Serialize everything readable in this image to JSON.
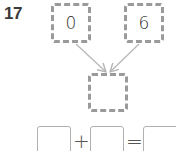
{
  "question": {
    "number": "17"
  },
  "number_bond": {
    "part_left": "0",
    "part_right": "6",
    "whole": ""
  },
  "equation": {
    "addend_1": "",
    "operator_plus": "+",
    "addend_2": "",
    "operator_equals": "=",
    "sum": ""
  },
  "colors": {
    "box_border": "#9a9a9a",
    "arrow": "#b5b5b5",
    "text": "#333333"
  }
}
